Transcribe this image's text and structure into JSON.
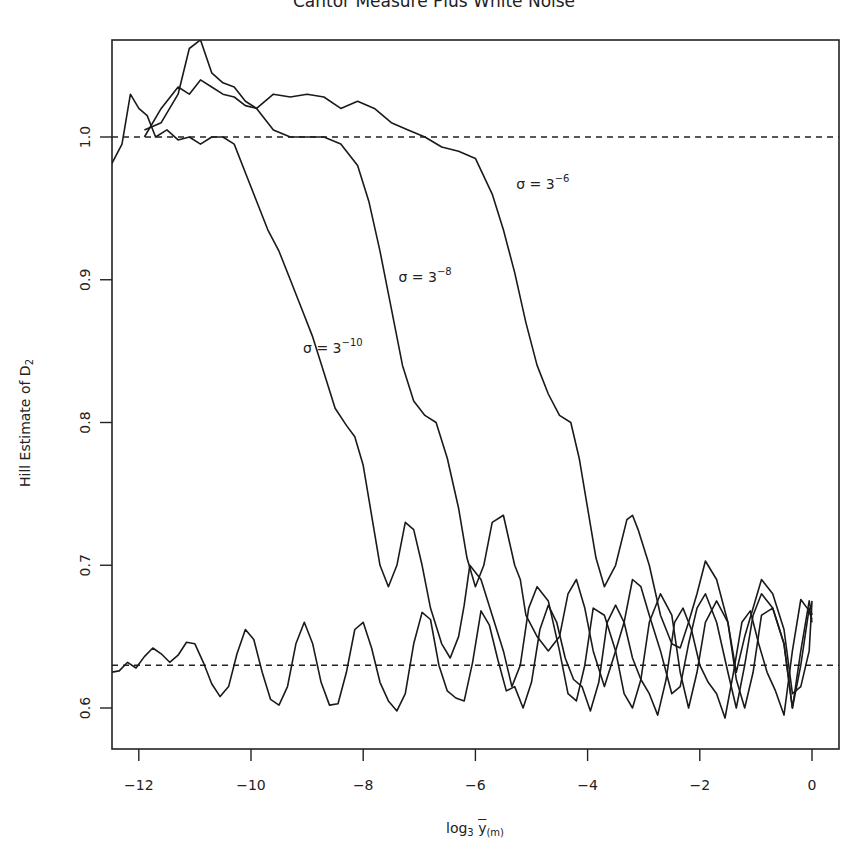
{
  "chart_data": {
    "type": "line",
    "title": "Cantor Measure Plus White Noise",
    "xlabel": "log3 ȳ(m)",
    "xlabel_parts": {
      "base": "log",
      "base_sub": "3",
      "var": "y",
      "var_sub": "(m)"
    },
    "ylabel": "Hill Estimate of D2",
    "ylabel_parts": {
      "text": "Hill Estimate of D",
      "sub": "2"
    },
    "xlim": [
      -12.5,
      0.5
    ],
    "ylim": [
      0.57,
      1.07
    ],
    "xticks": [
      -12,
      -10,
      -8,
      -6,
      -4,
      -2,
      0
    ],
    "xtick_labels": [
      "−12",
      "−10",
      "−8",
      "−6",
      "−4",
      "−2",
      "0"
    ],
    "yticks": [
      0.6,
      0.7,
      0.8,
      0.9,
      1.0
    ],
    "ytick_labels": [
      "0.6",
      "0.7",
      "0.8",
      "0.9",
      "1.0"
    ],
    "grid": false,
    "legend": null,
    "reference_lines": [
      {
        "orientation": "horizontal",
        "y": 1.0,
        "style": "dashed"
      },
      {
        "orientation": "horizontal",
        "y": 0.63,
        "style": "dashed"
      }
    ],
    "annotations": [
      {
        "text": "σ = 3^-6",
        "base": "σ = 3",
        "exp": "−6",
        "x": -5.2,
        "y": 0.962
      },
      {
        "text": "σ = 3^-8",
        "base": "σ = 3",
        "exp": "−8",
        "x": -7.3,
        "y": 0.897
      },
      {
        "text": "σ = 3^-10",
        "base": "σ = 3",
        "exp": "−10",
        "x": -9.0,
        "y": 0.847
      }
    ],
    "series": [
      {
        "name": "σ = 3^-6",
        "x": [
          -11.9,
          -11.6,
          -11.3,
          -11.1,
          -10.9,
          -10.7,
          -10.5,
          -10.3,
          -10.1,
          -9.9,
          -9.6,
          -9.3,
          -9.0,
          -8.7,
          -8.4,
          -8.1,
          -7.8,
          -7.5,
          -7.2,
          -6.9,
          -6.6,
          -6.3,
          -6.0,
          -5.7,
          -5.5,
          -5.3,
          -5.1,
          -4.9,
          -4.7,
          -4.5,
          -4.3,
          -4.15,
          -4.0,
          -3.85,
          -3.7,
          -3.5,
          -3.3,
          -3.2,
          -3.1,
          -2.9,
          -2.7,
          -2.5,
          -2.35,
          -2.2,
          -2.05,
          -1.9,
          -1.7,
          -1.5,
          -1.35,
          -1.2,
          -1.05,
          -0.9,
          -0.7,
          -0.5,
          -0.35,
          -0.2,
          -0.05,
          0.0
        ],
        "y": [
          1.005,
          1.01,
          1.03,
          1.062,
          1.068,
          1.045,
          1.038,
          1.035,
          1.025,
          1.02,
          1.03,
          1.028,
          1.03,
          1.028,
          1.02,
          1.025,
          1.02,
          1.01,
          1.005,
          1.0,
          0.993,
          0.99,
          0.985,
          0.96,
          0.935,
          0.905,
          0.87,
          0.84,
          0.82,
          0.805,
          0.8,
          0.775,
          0.74,
          0.705,
          0.685,
          0.7,
          0.732,
          0.735,
          0.725,
          0.7,
          0.665,
          0.645,
          0.642,
          0.66,
          0.68,
          0.703,
          0.69,
          0.66,
          0.625,
          0.65,
          0.67,
          0.69,
          0.68,
          0.655,
          0.61,
          0.615,
          0.64,
          0.675
        ]
      },
      {
        "name": "σ = 3^-8",
        "x": [
          -11.9,
          -11.6,
          -11.3,
          -11.1,
          -10.9,
          -10.7,
          -10.5,
          -10.3,
          -10.1,
          -9.9,
          -9.6,
          -9.3,
          -9.0,
          -8.7,
          -8.4,
          -8.1,
          -7.9,
          -7.7,
          -7.5,
          -7.3,
          -7.1,
          -6.9,
          -6.7,
          -6.5,
          -6.3,
          -6.15,
          -6.0,
          -5.85,
          -5.7,
          -5.5,
          -5.3,
          -5.2,
          -5.1,
          -4.9,
          -4.7,
          -4.5,
          -4.35,
          -4.2,
          -4.05,
          -3.9,
          -3.7,
          -3.5,
          -3.35,
          -3.2,
          -3.05,
          -2.9,
          -2.7,
          -2.5,
          -2.35,
          -2.2,
          -2.05,
          -1.9,
          -1.7,
          -1.5,
          -1.35,
          -1.2,
          -1.05,
          -0.9,
          -0.7,
          -0.5,
          -0.35,
          -0.2,
          -0.05,
          0.0
        ],
        "y": [
          1.0,
          1.02,
          1.035,
          1.03,
          1.04,
          1.035,
          1.03,
          1.028,
          1.022,
          1.02,
          1.005,
          1.0,
          1.0,
          1.0,
          0.995,
          0.98,
          0.955,
          0.92,
          0.88,
          0.84,
          0.815,
          0.805,
          0.8,
          0.775,
          0.74,
          0.705,
          0.685,
          0.7,
          0.73,
          0.735,
          0.7,
          0.69,
          0.665,
          0.65,
          0.64,
          0.65,
          0.68,
          0.69,
          0.67,
          0.64,
          0.615,
          0.64,
          0.66,
          0.69,
          0.685,
          0.665,
          0.64,
          0.61,
          0.615,
          0.645,
          0.67,
          0.68,
          0.66,
          0.625,
          0.6,
          0.63,
          0.665,
          0.68,
          0.67,
          0.645,
          0.6,
          0.64,
          0.675,
          0.665
        ]
      },
      {
        "name": "σ = 3^-10",
        "x": [
          -12.5,
          -12.3,
          -12.15,
          -12.0,
          -11.85,
          -11.7,
          -11.5,
          -11.3,
          -11.1,
          -10.9,
          -10.7,
          -10.5,
          -10.3,
          -10.1,
          -9.9,
          -9.7,
          -9.5,
          -9.3,
          -9.1,
          -8.9,
          -8.7,
          -8.5,
          -8.3,
          -8.15,
          -8.0,
          -7.85,
          -7.7,
          -7.55,
          -7.4,
          -7.25,
          -7.1,
          -6.95,
          -6.8,
          -6.6,
          -6.45,
          -6.3,
          -6.2,
          -6.1,
          -5.9,
          -5.7,
          -5.5,
          -5.35,
          -5.2,
          -5.05,
          -4.9,
          -4.7,
          -4.5,
          -4.35,
          -4.2,
          -4.05,
          -3.9,
          -3.7,
          -3.5,
          -3.35,
          -3.2,
          -3.05,
          -2.9,
          -2.7,
          -2.5,
          -2.35,
          -2.2,
          -2.05,
          -1.9,
          -1.7,
          -1.5,
          -1.35,
          -1.2,
          -1.05,
          -0.9,
          -0.7,
          -0.5,
          -0.35,
          -0.2,
          -0.05,
          0.0
        ],
        "y": [
          0.98,
          0.995,
          1.03,
          1.02,
          1.015,
          1.0,
          1.005,
          0.998,
          1.0,
          0.995,
          1.0,
          1.0,
          0.995,
          0.975,
          0.955,
          0.935,
          0.92,
          0.9,
          0.88,
          0.86,
          0.835,
          0.81,
          0.798,
          0.79,
          0.77,
          0.735,
          0.7,
          0.685,
          0.7,
          0.73,
          0.725,
          0.7,
          0.67,
          0.645,
          0.635,
          0.65,
          0.672,
          0.7,
          0.69,
          0.665,
          0.64,
          0.615,
          0.63,
          0.67,
          0.685,
          0.675,
          0.64,
          0.61,
          0.605,
          0.63,
          0.67,
          0.665,
          0.64,
          0.61,
          0.6,
          0.62,
          0.66,
          0.68,
          0.665,
          0.625,
          0.6,
          0.625,
          0.66,
          0.675,
          0.66,
          0.62,
          0.6,
          0.625,
          0.665,
          0.67,
          0.645,
          0.6,
          0.63,
          0.67,
          0.66
        ]
      },
      {
        "name": "no noise (σ = 0)",
        "x": [
          -12.5,
          -12.35,
          -12.2,
          -12.05,
          -11.9,
          -11.75,
          -11.6,
          -11.45,
          -11.3,
          -11.15,
          -11.0,
          -10.85,
          -10.7,
          -10.55,
          -10.4,
          -10.25,
          -10.1,
          -9.95,
          -9.8,
          -9.65,
          -9.5,
          -9.35,
          -9.2,
          -9.05,
          -8.9,
          -8.75,
          -8.6,
          -8.45,
          -8.3,
          -8.15,
          -8.0,
          -7.85,
          -7.7,
          -7.55,
          -7.4,
          -7.25,
          -7.1,
          -6.95,
          -6.8,
          -6.65,
          -6.5,
          -6.35,
          -6.2,
          -6.05,
          -5.9,
          -5.75,
          -5.6,
          -5.45,
          -5.3,
          -5.15,
          -5.0,
          -4.85,
          -4.7,
          -4.55,
          -4.4,
          -4.25,
          -4.1,
          -3.95,
          -3.8,
          -3.65,
          -3.5,
          -3.35,
          -3.2,
          -3.05,
          -2.9,
          -2.75,
          -2.6,
          -2.45,
          -2.3,
          -2.15,
          -2.0,
          -1.85,
          -1.7,
          -1.55,
          -1.4,
          -1.25,
          -1.1,
          -0.95,
          -0.8,
          -0.65,
          -0.5,
          -0.35,
          -0.2,
          -0.05,
          0.0
        ],
        "y": [
          0.625,
          0.626,
          0.632,
          0.628,
          0.636,
          0.642,
          0.638,
          0.632,
          0.637,
          0.646,
          0.645,
          0.632,
          0.617,
          0.608,
          0.615,
          0.638,
          0.655,
          0.648,
          0.625,
          0.606,
          0.602,
          0.615,
          0.645,
          0.66,
          0.645,
          0.618,
          0.602,
          0.603,
          0.625,
          0.655,
          0.66,
          0.642,
          0.618,
          0.605,
          0.598,
          0.61,
          0.645,
          0.667,
          0.662,
          0.63,
          0.612,
          0.607,
          0.605,
          0.632,
          0.668,
          0.658,
          0.634,
          0.612,
          0.615,
          0.6,
          0.618,
          0.655,
          0.672,
          0.66,
          0.635,
          0.62,
          0.615,
          0.598,
          0.618,
          0.66,
          0.672,
          0.66,
          0.635,
          0.62,
          0.61,
          0.595,
          0.62,
          0.66,
          0.67,
          0.655,
          0.63,
          0.618,
          0.61,
          0.593,
          0.625,
          0.66,
          0.668,
          0.645,
          0.625,
          0.612,
          0.595,
          0.64,
          0.676,
          0.668,
          0.662
        ]
      }
    ]
  }
}
